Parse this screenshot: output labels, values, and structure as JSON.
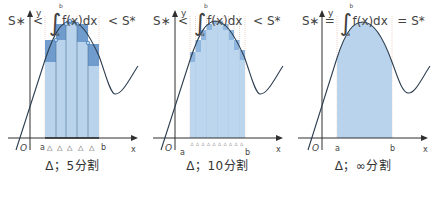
{
  "colors": {
    "axis": "#2f2f2f",
    "curve": "#2c3e50",
    "fill_light": "#bcd6ee",
    "fill_mid": "#8fb6de",
    "fill_dark": "#5d8fc4",
    "guide": "#d9a58f",
    "point": "#3e78b8"
  },
  "panels": [
    {
      "id": "five",
      "axis_labels": {
        "y": "y",
        "x": "x",
        "origin": "O",
        "a": "a",
        "b": "b"
      },
      "tick_marker": "△",
      "tick_count": 5,
      "caption": "Δ；5分割",
      "formula": {
        "left": "S∗",
        "op1": "<",
        "integral": "∫",
        "upper": "b",
        "lower": "a",
        "integrand": "f(x)dx",
        "op2": "<",
        "right": "S*"
      }
    },
    {
      "id": "ten",
      "axis_labels": {
        "y": "y",
        "x": "x",
        "origin": "O",
        "a": "a",
        "b": "b"
      },
      "tick_marker": "△",
      "tick_count": 10,
      "caption": "Δ；10分割",
      "formula": {
        "left": "S∗",
        "op1": "<",
        "integral": "∫",
        "upper": "b",
        "lower": "a",
        "integrand": "f(x)dx",
        "op2": "<",
        "right": "S*"
      }
    },
    {
      "id": "infinity",
      "axis_labels": {
        "y": "y",
        "x": "x",
        "origin": "O",
        "a": "a",
        "b": "b"
      },
      "tick_marker": "",
      "tick_count": 0,
      "caption": "Δ；∞分割",
      "formula": {
        "left": "S∗",
        "op1": "=",
        "integral": "∫",
        "upper": "b",
        "lower": "a",
        "integrand": "f(x)dx",
        "op2": "=",
        "right": "S*"
      }
    }
  ]
}
